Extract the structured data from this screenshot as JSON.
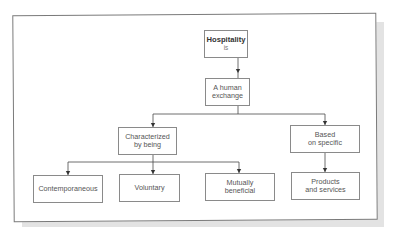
{
  "diagram": {
    "root": {
      "title": "Hospitality",
      "subtitle": "is"
    },
    "level1": {
      "label_line1": "A human",
      "label_line2": "exchange"
    },
    "level2": [
      {
        "label_line1": "Characterized",
        "label_line2": "by being"
      },
      {
        "label_line1": "Based",
        "label_line2": "on specific"
      }
    ],
    "level3": [
      {
        "label_line1": "Contemporaneous",
        "label_line2": ""
      },
      {
        "label_line1": "Voluntary",
        "label_line2": ""
      },
      {
        "label_line1": "Mutually",
        "label_line2": "beneficial"
      },
      {
        "label_line1": "Products",
        "label_line2": "and services"
      }
    ],
    "colors": {
      "line": "#4a4a4a",
      "box_border": "#8a8a8a",
      "frame": "#7a7a7a",
      "shadow": "#e3e3e3"
    }
  }
}
